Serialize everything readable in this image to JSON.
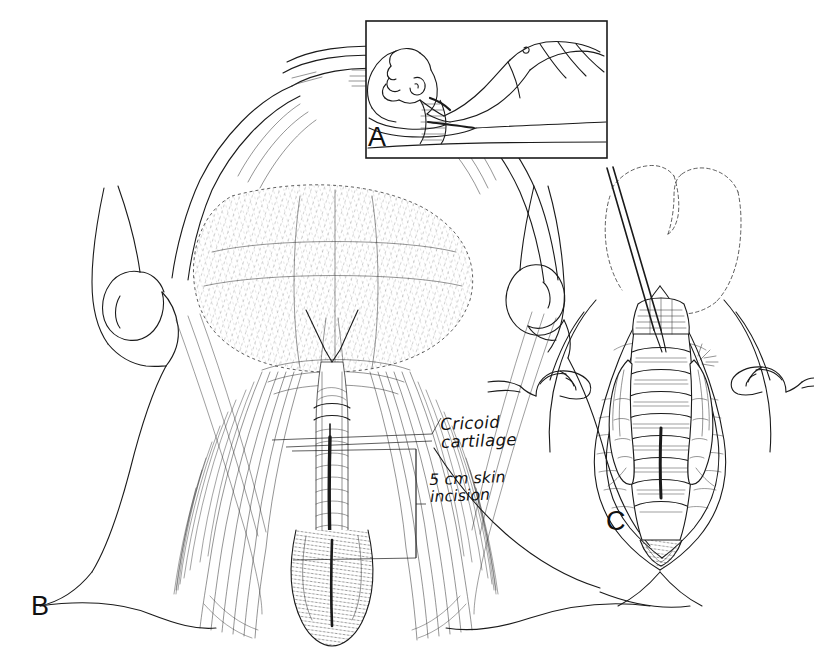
{
  "figure": {
    "kind": "medical-line-illustration",
    "background_color": "#ffffff",
    "ink_color": "#1a1a1a"
  },
  "panels": [
    {
      "id": "A",
      "letter": "A",
      "caption": "",
      "description": "Patient supine with neck extended over shoulder roll, draped",
      "has_border": true
    },
    {
      "id": "B",
      "letter": "B",
      "caption": "",
      "description": "Anterior neck anatomy showing midline vertical skin incision",
      "has_border": false
    },
    {
      "id": "C",
      "letter": "C",
      "caption": "",
      "description": "Exposed trachea retracted, vertical tracheal incision",
      "has_border": false
    }
  ],
  "annotations": [
    {
      "id": "cricoid",
      "text": "Cricoid\ncartilage",
      "leader": "horizontal-line-to-midline",
      "x": 438,
      "y": 423
    },
    {
      "id": "incision",
      "text": "5 cm skin\nincision",
      "leader": "bracket-span",
      "x": 429,
      "y": 478
    }
  ],
  "panel_letters": {
    "a": "A",
    "b": "B",
    "c": "C"
  }
}
